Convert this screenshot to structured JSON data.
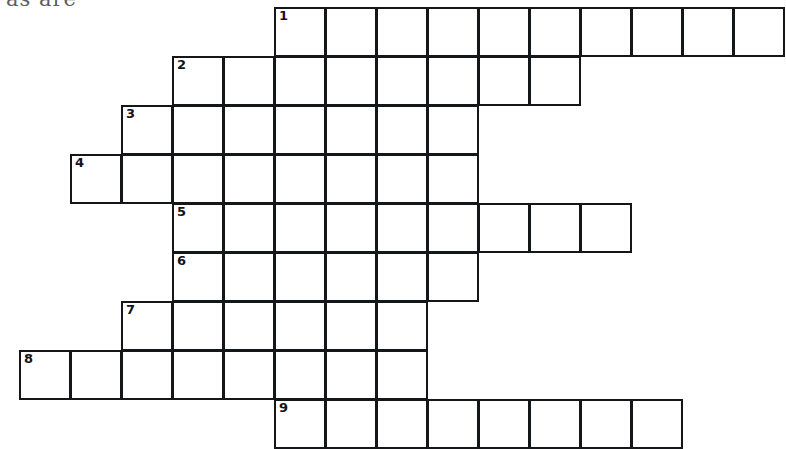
{
  "page": {
    "width": 786,
    "height": 449,
    "background_color": "#ffffff",
    "ink_color": "#15161a",
    "header_text_fragment": "as are"
  },
  "puzzle": {
    "type": "crossword",
    "orientation": "across-only staircase",
    "cell_width": 51,
    "cell_height": 49,
    "origin_x": 20,
    "origin_y": 8,
    "columns": 16,
    "rows": 9,
    "clue_numbers": [
      "1",
      "2",
      "3",
      "4",
      "5",
      "6",
      "7",
      "8",
      "9"
    ],
    "entries": [
      {
        "number": "1",
        "row": 0,
        "start_col": 5,
        "length": 10,
        "clipped_right": true
      },
      {
        "number": "2",
        "row": 1,
        "start_col": 3,
        "length": 8,
        "clipped_right": false
      },
      {
        "number": "3",
        "row": 2,
        "start_col": 2,
        "length": 7,
        "clipped_right": false
      },
      {
        "number": "4",
        "row": 3,
        "start_col": 1,
        "length": 8,
        "clipped_right": false
      },
      {
        "number": "5",
        "row": 4,
        "start_col": 3,
        "length": 9,
        "clipped_right": false
      },
      {
        "number": "6",
        "row": 5,
        "start_col": 3,
        "length": 6,
        "clipped_right": false
      },
      {
        "number": "7",
        "row": 6,
        "start_col": 2,
        "length": 6,
        "clipped_right": false
      },
      {
        "number": "8",
        "row": 7,
        "start_col": 0,
        "length": 8,
        "clipped_right": false
      },
      {
        "number": "9",
        "row": 8,
        "start_col": 5,
        "length": 8,
        "clipped_right": false
      }
    ],
    "filled_letters": []
  }
}
